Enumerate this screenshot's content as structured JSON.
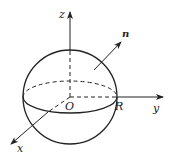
{
  "figure": {
    "type": "sphere-coordinate-diagram"
  },
  "labels": {
    "z_axis": "z",
    "y_axis": "y",
    "x_axis": "x",
    "origin": "O",
    "radius": "R",
    "normal": "n"
  },
  "colors": {
    "stroke": "#222222",
    "background": "#ffffff"
  }
}
